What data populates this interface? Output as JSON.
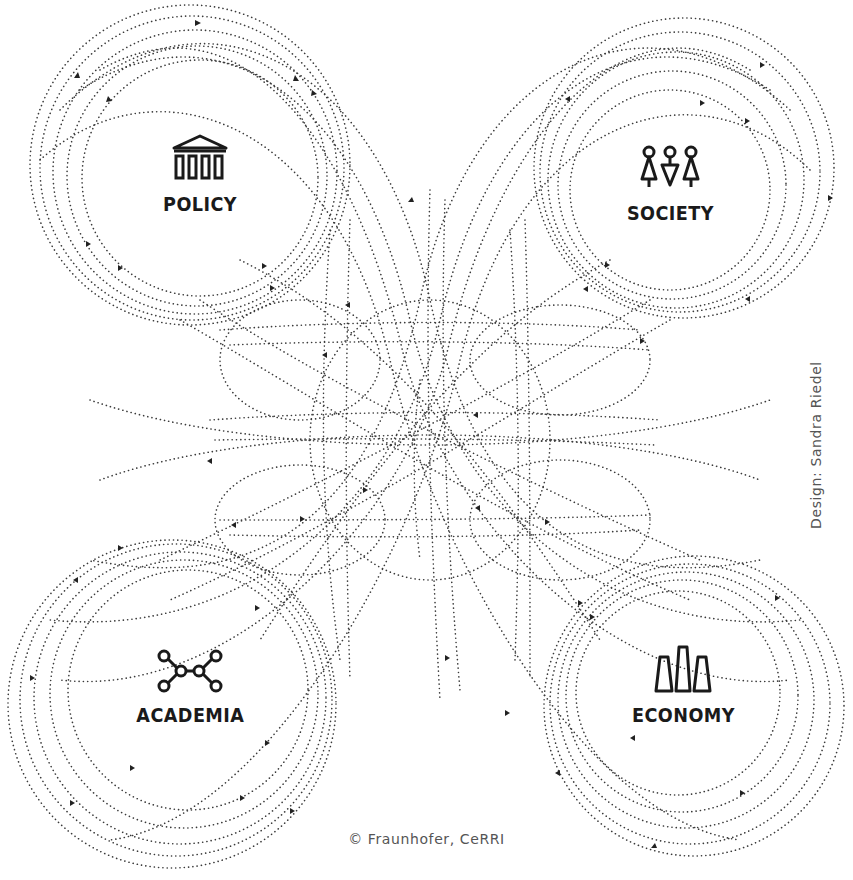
{
  "diagram": {
    "type": "four-domain network diagram with dotted interconnecting paths",
    "line_style": "dotted",
    "line_color": "#333333",
    "background": "#ffffff",
    "nodes": [
      {
        "id": "policy",
        "label": "POLICY",
        "icon": "building-columns-icon",
        "center": [
          200,
          175
        ],
        "radius": 115
      },
      {
        "id": "society",
        "label": "SOCIETY",
        "icon": "people-icon",
        "center": [
          668,
          188
        ],
        "radius": 100
      },
      {
        "id": "academia",
        "label": "ACADEMIA",
        "icon": "molecule-network-icon",
        "center": [
          188,
          690
        ],
        "radius": 118
      },
      {
        "id": "economy",
        "label": "ECONOMY",
        "icon": "bar-columns-icon",
        "center": [
          678,
          693
        ],
        "radius": 100
      }
    ]
  },
  "credits": {
    "copyright": "© Fraunhofer, CeRRI",
    "design": "Design: Sandra Riedel"
  }
}
